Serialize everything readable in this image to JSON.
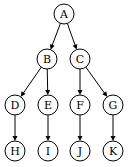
{
  "diagram": {
    "type": "tree",
    "nodes": [
      {
        "id": "A",
        "label": "A",
        "x": 64,
        "y": 14
      },
      {
        "id": "B",
        "label": "B",
        "x": 47,
        "y": 59
      },
      {
        "id": "C",
        "label": "C",
        "x": 80,
        "y": 59
      },
      {
        "id": "D",
        "label": "D",
        "x": 15,
        "y": 105
      },
      {
        "id": "E",
        "label": "E",
        "x": 48,
        "y": 105
      },
      {
        "id": "F",
        "label": "F",
        "x": 80,
        "y": 105
      },
      {
        "id": "G",
        "label": "G",
        "x": 113,
        "y": 105
      },
      {
        "id": "H",
        "label": "H",
        "x": 15,
        "y": 151
      },
      {
        "id": "I",
        "label": "I",
        "x": 48,
        "y": 151
      },
      {
        "id": "J",
        "label": "J",
        "x": 80,
        "y": 151
      },
      {
        "id": "K",
        "label": "K",
        "x": 113,
        "y": 151
      }
    ],
    "edges": [
      {
        "from": "A",
        "to": "B"
      },
      {
        "from": "A",
        "to": "C"
      },
      {
        "from": "B",
        "to": "D"
      },
      {
        "from": "B",
        "to": "E"
      },
      {
        "from": "C",
        "to": "F"
      },
      {
        "from": "C",
        "to": "G"
      },
      {
        "from": "D",
        "to": "H"
      },
      {
        "from": "E",
        "to": "I"
      },
      {
        "from": "F",
        "to": "J"
      },
      {
        "from": "G",
        "to": "K"
      }
    ],
    "node_radius": 10,
    "colors": {
      "stroke": "#000000",
      "fill": "#ffffff"
    }
  }
}
